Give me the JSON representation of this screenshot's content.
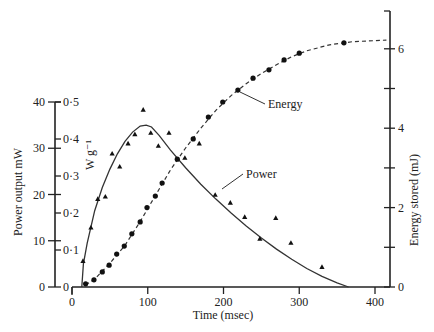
{
  "chart_data": {
    "type": "line",
    "title": "",
    "xlabel": "Time (msec)",
    "ylabel": "Power output  mW",
    "ylabel_secondary_inner": "W g⁻¹",
    "ylabel_right": "Energy stored (mJ)",
    "xlim": [
      0,
      420
    ],
    "ylim": [
      0,
      40
    ],
    "ylim_inner": [
      0,
      0.5
    ],
    "ylim_right": [
      0,
      7
    ],
    "x_ticks": [
      0,
      100,
      200,
      300,
      400
    ],
    "y_ticks": [
      0,
      10,
      20,
      30,
      40
    ],
    "y_ticks_inner": [
      "0",
      "0·1",
      "0·2",
      "0·3",
      "0·4",
      "0·5"
    ],
    "y_ticks_right": [
      0,
      1,
      2,
      3,
      4,
      5,
      6
    ],
    "y_tick_labels_right": [
      "0",
      "",
      "2",
      "",
      "4",
      "",
      "6"
    ],
    "grid": false,
    "legend": "inline labels with leader lines",
    "series": [
      {
        "name": "Power",
        "axis": "left",
        "marker": "triangle",
        "points": [
          [
            14.5,
            5.6
          ],
          [
            25,
            12.8
          ],
          [
            34,
            19.0
          ],
          [
            44,
            19.5
          ],
          [
            53,
            28.8
          ],
          [
            63,
            26.0
          ],
          [
            74,
            31.0
          ],
          [
            83,
            33.0
          ],
          [
            94,
            38.3
          ],
          [
            104,
            33.3
          ],
          [
            114,
            30.5
          ],
          [
            128,
            33.3
          ],
          [
            149,
            27.9
          ],
          [
            168,
            31.0
          ],
          [
            189,
            19.9
          ],
          [
            209,
            18.2
          ],
          [
            228,
            15.1
          ],
          [
            248,
            10.4
          ],
          [
            269,
            14.9
          ],
          [
            289,
            9.5
          ],
          [
            330,
            4.3
          ]
        ],
        "fit_curve": [
          [
            13,
            0
          ],
          [
            15,
            5
          ],
          [
            20,
            9.5
          ],
          [
            30,
            16.5
          ],
          [
            40,
            21.5
          ],
          [
            50,
            25.5
          ],
          [
            60,
            28.8
          ],
          [
            70,
            31.5
          ],
          [
            80,
            33.5
          ],
          [
            90,
            34.8
          ],
          [
            98,
            35.0
          ],
          [
            105,
            34.6
          ],
          [
            115,
            32.8
          ],
          [
            130,
            29.6
          ],
          [
            150,
            25.8
          ],
          [
            170,
            22.2
          ],
          [
            190,
            19.0
          ],
          [
            210,
            16.0
          ],
          [
            230,
            13.2
          ],
          [
            250,
            10.6
          ],
          [
            270,
            8.2
          ],
          [
            290,
            6.0
          ],
          [
            310,
            4.0
          ],
          [
            330,
            2.3
          ],
          [
            350,
            0.9
          ],
          [
            365,
            0
          ]
        ]
      },
      {
        "name": "Energy",
        "axis": "right",
        "marker": "circle",
        "points": [
          [
            18,
            0.08
          ],
          [
            29,
            0.18
          ],
          [
            40,
            0.38
          ],
          [
            49,
            0.55
          ],
          [
            59,
            0.83
          ],
          [
            69,
            1.03
          ],
          [
            79,
            1.34
          ],
          [
            90,
            1.64
          ],
          [
            99,
            2.0
          ],
          [
            110,
            2.29
          ],
          [
            119,
            2.62
          ],
          [
            139,
            3.22
          ],
          [
            160,
            3.73
          ],
          [
            180,
            4.28
          ],
          [
            199,
            4.66
          ],
          [
            219,
            4.96
          ],
          [
            239,
            5.26
          ],
          [
            260,
            5.47
          ],
          [
            280,
            5.72
          ],
          [
            300,
            5.89
          ],
          [
            359,
            6.15
          ]
        ],
        "fit_curve": [
          [
            18,
            0.05
          ],
          [
            30,
            0.2
          ],
          [
            50,
            0.6
          ],
          [
            70,
            1.05
          ],
          [
            90,
            1.65
          ],
          [
            110,
            2.3
          ],
          [
            130,
            2.95
          ],
          [
            150,
            3.5
          ],
          [
            170,
            4.0
          ],
          [
            190,
            4.45
          ],
          [
            210,
            4.82
          ],
          [
            230,
            5.12
          ],
          [
            250,
            5.38
          ],
          [
            270,
            5.6
          ],
          [
            290,
            5.8
          ],
          [
            310,
            5.95
          ],
          [
            340,
            6.1
          ],
          [
            370,
            6.18
          ],
          [
            415,
            6.22
          ]
        ]
      }
    ],
    "annotations": [
      {
        "text": "Energy",
        "series": "Energy",
        "label_at": [
          268,
          108
        ],
        "arrow_to": [
          240,
          92
        ]
      },
      {
        "text": "Power",
        "series": "Power",
        "label_at": [
          246,
          178
        ],
        "arrow_to": [
          222,
          189
        ]
      }
    ]
  }
}
